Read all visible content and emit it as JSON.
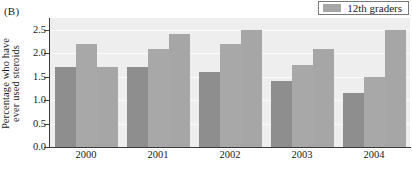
{
  "panel": {
    "label": "(B)"
  },
  "legend": {
    "entries": [
      {
        "label": "12th graders",
        "color": "#a6a6a6"
      }
    ],
    "position": "top-right"
  },
  "colors": {
    "bar_dark": "#8e8e8e",
    "bar_light": "#a8a8a8",
    "plot_background": "#eeeeee",
    "gridline": "#fbfbfb",
    "axis": "#3b3b3b"
  },
  "chart_data": {
    "type": "bar",
    "title": "",
    "subtitle": "",
    "xlabel": "",
    "ylabel": "Percentage who have ever used steroids",
    "ylabel_lines": [
      "Percentage who have",
      "ever used steroids"
    ],
    "categories": [
      "2000",
      "2001",
      "2002",
      "2003",
      "2004"
    ],
    "ylim": [
      0.0,
      2.75
    ],
    "yticks": [
      0.0,
      0.5,
      1.0,
      1.5,
      2.0,
      2.5
    ],
    "ytick_labels": [
      "0.0",
      "0.5",
      "1.0",
      "1.5",
      "2.0",
      "2.5"
    ],
    "grid": true,
    "legend_position": "top-right",
    "series": [
      {
        "name": "bar-1",
        "color": "#8e8e8e",
        "values": [
          1.7,
          1.7,
          1.6,
          1.4,
          1.15
        ]
      },
      {
        "name": "bar-2",
        "color": "#a8a8a8",
        "values": [
          2.2,
          2.1,
          2.2,
          1.75,
          1.5
        ]
      },
      {
        "name": "12th graders",
        "color": "#a6a6a6",
        "values": [
          1.7,
          2.4,
          2.5,
          2.1,
          2.5
        ]
      }
    ]
  }
}
